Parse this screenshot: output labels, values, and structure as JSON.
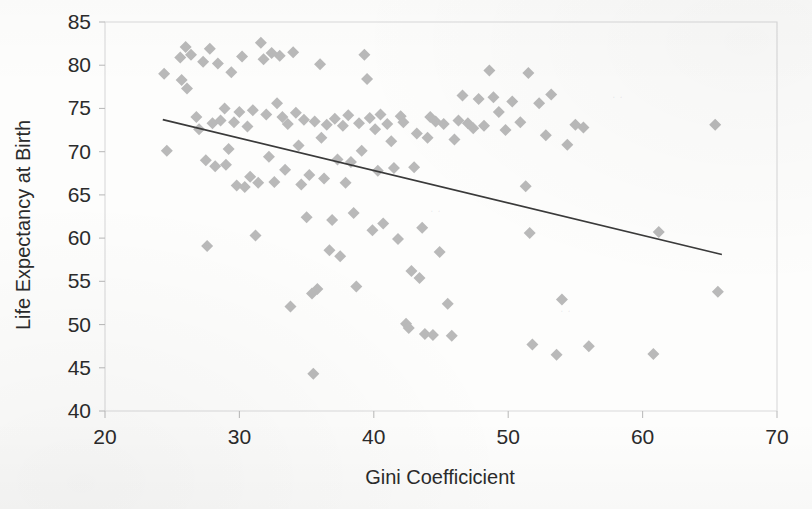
{
  "chart_data": {
    "type": "scatter",
    "title": "",
    "xlabel": "Gini Coefficicient",
    "ylabel": "Life Expectancy at Birth",
    "xlim": [
      20,
      70
    ],
    "ylim": [
      40,
      85
    ],
    "xticks": [
      20,
      30,
      40,
      50,
      60,
      70
    ],
    "yticks": [
      40,
      45,
      50,
      55,
      60,
      65,
      70,
      75,
      80,
      85
    ],
    "grid": false,
    "legend": "none",
    "marker": {
      "shape": "diamond",
      "color": "#b9b9b9",
      "size": 11
    },
    "trendline": {
      "type": "linear",
      "color": "#3a3a3a",
      "x_start": 24.3,
      "y_start": 73.7,
      "x_end": 65.9,
      "y_end": 58.1
    },
    "points": [
      [
        24.4,
        79.0
      ],
      [
        24.6,
        70.1
      ],
      [
        25.6,
        80.9
      ],
      [
        25.7,
        78.3
      ],
      [
        26.0,
        82.1
      ],
      [
        26.1,
        77.3
      ],
      [
        26.4,
        81.2
      ],
      [
        26.8,
        74.0
      ],
      [
        27.0,
        72.6
      ],
      [
        27.3,
        80.4
      ],
      [
        27.5,
        69.0
      ],
      [
        27.6,
        59.1
      ],
      [
        27.8,
        81.9
      ],
      [
        28.0,
        73.3
      ],
      [
        28.2,
        68.3
      ],
      [
        28.4,
        80.2
      ],
      [
        28.6,
        73.6
      ],
      [
        28.9,
        75.0
      ],
      [
        29.0,
        68.5
      ],
      [
        29.2,
        70.3
      ],
      [
        29.4,
        79.2
      ],
      [
        29.6,
        73.4
      ],
      [
        29.8,
        66.1
      ],
      [
        30.0,
        74.6
      ],
      [
        30.2,
        81.0
      ],
      [
        30.4,
        65.9
      ],
      [
        30.6,
        72.9
      ],
      [
        30.8,
        67.1
      ],
      [
        31.0,
        74.8
      ],
      [
        31.2,
        60.3
      ],
      [
        31.4,
        66.4
      ],
      [
        31.6,
        82.6
      ],
      [
        31.8,
        80.7
      ],
      [
        32.0,
        74.3
      ],
      [
        32.2,
        69.4
      ],
      [
        32.4,
        81.4
      ],
      [
        32.6,
        66.5
      ],
      [
        32.8,
        75.6
      ],
      [
        33.0,
        81.1
      ],
      [
        33.2,
        74.0
      ],
      [
        33.4,
        67.9
      ],
      [
        33.6,
        73.2
      ],
      [
        33.8,
        52.1
      ],
      [
        34.0,
        81.5
      ],
      [
        34.2,
        74.5
      ],
      [
        34.4,
        70.7
      ],
      [
        34.6,
        66.2
      ],
      [
        34.8,
        73.7
      ],
      [
        35.0,
        62.4
      ],
      [
        35.2,
        67.3
      ],
      [
        35.4,
        53.6
      ],
      [
        35.5,
        44.3
      ],
      [
        35.6,
        73.5
      ],
      [
        35.8,
        54.1
      ],
      [
        36.0,
        80.1
      ],
      [
        36.1,
        71.6
      ],
      [
        36.3,
        66.9
      ],
      [
        36.5,
        73.1
      ],
      [
        36.7,
        58.6
      ],
      [
        36.9,
        62.1
      ],
      [
        37.1,
        73.8
      ],
      [
        37.3,
        69.1
      ],
      [
        37.5,
        57.9
      ],
      [
        37.7,
        73.0
      ],
      [
        37.9,
        66.4
      ],
      [
        38.1,
        74.2
      ],
      [
        38.3,
        68.8
      ],
      [
        38.5,
        62.9
      ],
      [
        38.7,
        54.4
      ],
      [
        38.9,
        73.3
      ],
      [
        39.1,
        70.1
      ],
      [
        39.3,
        81.2
      ],
      [
        39.5,
        78.4
      ],
      [
        39.7,
        73.9
      ],
      [
        39.9,
        60.9
      ],
      [
        40.1,
        72.6
      ],
      [
        40.3,
        67.8
      ],
      [
        40.5,
        74.3
      ],
      [
        40.7,
        61.7
      ],
      [
        41.0,
        73.2
      ],
      [
        41.3,
        71.2
      ],
      [
        41.5,
        68.1
      ],
      [
        41.8,
        59.9
      ],
      [
        42.0,
        74.1
      ],
      [
        42.2,
        73.4
      ],
      [
        42.4,
        50.1
      ],
      [
        42.6,
        49.6
      ],
      [
        42.8,
        56.2
      ],
      [
        43.0,
        68.2
      ],
      [
        43.2,
        72.1
      ],
      [
        43.4,
        55.4
      ],
      [
        43.6,
        61.2
      ],
      [
        43.8,
        48.9
      ],
      [
        44.0,
        71.6
      ],
      [
        44.2,
        74.0
      ],
      [
        44.4,
        48.8
      ],
      [
        44.6,
        73.5
      ],
      [
        44.9,
        58.4
      ],
      [
        45.2,
        73.2
      ],
      [
        45.5,
        52.4
      ],
      [
        45.8,
        48.7
      ],
      [
        46.0,
        71.4
      ],
      [
        46.3,
        73.6
      ],
      [
        46.6,
        76.5
      ],
      [
        47.0,
        73.3
      ],
      [
        47.4,
        72.7
      ],
      [
        47.8,
        76.1
      ],
      [
        48.2,
        73.0
      ],
      [
        48.6,
        79.4
      ],
      [
        48.9,
        76.3
      ],
      [
        49.3,
        74.6
      ],
      [
        49.8,
        72.5
      ],
      [
        50.3,
        75.8
      ],
      [
        50.9,
        73.4
      ],
      [
        51.3,
        66.0
      ],
      [
        51.5,
        79.1
      ],
      [
        51.6,
        60.6
      ],
      [
        51.8,
        47.7
      ],
      [
        52.3,
        75.6
      ],
      [
        52.8,
        71.9
      ],
      [
        53.2,
        76.6
      ],
      [
        53.6,
        46.5
      ],
      [
        54.0,
        52.9
      ],
      [
        54.4,
        70.8
      ],
      [
        55.0,
        73.1
      ],
      [
        55.6,
        72.8
      ],
      [
        56.0,
        47.5
      ],
      [
        60.8,
        46.6
      ],
      [
        61.2,
        60.7
      ],
      [
        65.4,
        73.1
      ],
      [
        65.6,
        53.8
      ]
    ]
  },
  "axis": {
    "x_tick_labels": [
      "20",
      "30",
      "40",
      "50",
      "60",
      "70"
    ],
    "y_tick_labels": [
      "40",
      "45",
      "50",
      "55",
      "60",
      "65",
      "70",
      "75",
      "80",
      "85"
    ],
    "x_title": "Gini Coefficicient",
    "y_title": "Life Expectancy at Birth"
  },
  "colors": {
    "marker": "#b9b9b9",
    "trendline": "#3a3a3a",
    "frame": "#d9d9d9",
    "text": "#2b2b2b",
    "background": "#fdfdfc"
  }
}
